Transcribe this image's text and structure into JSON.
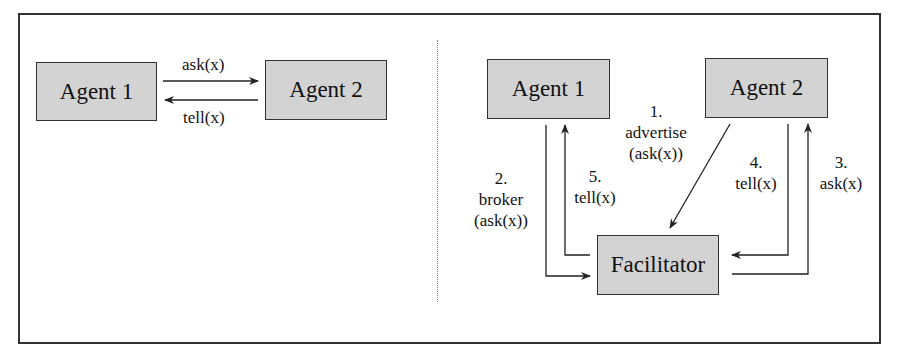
{
  "left_panel": {
    "agent1": "Agent 1",
    "agent2": "Agent 2",
    "ask_label": "ask(x)",
    "tell_label": "tell(x)"
  },
  "right_panel": {
    "agent1": "Agent 1",
    "agent2": "Agent 2",
    "facilitator": "Facilitator",
    "step1_num": "1.",
    "step1_text": "advertise",
    "step1_arg": "(ask(x))",
    "step2_num": "2.",
    "step2_text": "broker",
    "step2_arg": "(ask(x))",
    "step3_num": "3.",
    "step3_text": "ask(x)",
    "step4_num": "4.",
    "step4_text": "tell(x)",
    "step5_num": "5.",
    "step5_text": "tell(x)"
  },
  "colors": {
    "box_fill": "#d3d3d3",
    "line": "#333333"
  }
}
